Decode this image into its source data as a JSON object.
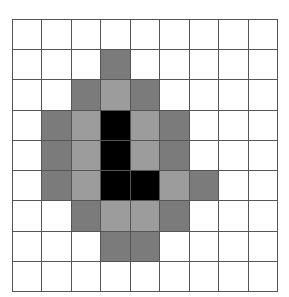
{
  "grid": {
    "rows": 9,
    "cols": 9,
    "colors": {
      "0": "#ffffff",
      "1": "#7b7b7b",
      "2": "#9c9c9c",
      "3": "#000000"
    },
    "legend": {
      "0": "white",
      "1": "dark-gray",
      "2": "light-gray",
      "3": "black"
    },
    "cells": [
      [
        0,
        0,
        0,
        0,
        0,
        0,
        0,
        0,
        0
      ],
      [
        0,
        0,
        0,
        1,
        0,
        0,
        0,
        0,
        0
      ],
      [
        0,
        0,
        1,
        2,
        1,
        0,
        0,
        0,
        0
      ],
      [
        0,
        1,
        2,
        3,
        2,
        1,
        0,
        0,
        0
      ],
      [
        0,
        1,
        2,
        3,
        2,
        1,
        0,
        0,
        0
      ],
      [
        0,
        1,
        2,
        3,
        3,
        2,
        1,
        0,
        0
      ],
      [
        0,
        0,
        1,
        2,
        2,
        1,
        0,
        0,
        0
      ],
      [
        0,
        0,
        0,
        1,
        1,
        0,
        0,
        0,
        0
      ],
      [
        0,
        0,
        0,
        0,
        0,
        0,
        0,
        0,
        0
      ]
    ]
  }
}
